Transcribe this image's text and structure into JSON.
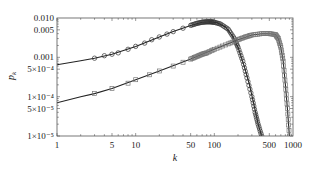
{
  "chart_data": {
    "type": "scatter",
    "title": "",
    "xlabel": "k",
    "ylabel": "p_k",
    "xscale": "log",
    "yscale": "log",
    "xlim": [
      1,
      1000
    ],
    "ylim": [
      1e-05,
      0.01
    ],
    "x_ticks": [
      1,
      5,
      10,
      50,
      100,
      500,
      1000
    ],
    "x_tick_labels": [
      "1",
      "5",
      "10",
      "50",
      "100",
      "500",
      "1000"
    ],
    "y_ticks": [
      1e-05,
      5e-05,
      0.0001,
      0.0005,
      0.001,
      0.005,
      0.01
    ],
    "y_tick_labels": [
      "1×10⁻⁵",
      "5×10⁻⁵",
      "1×10⁻⁴",
      "5×10⁻⁴",
      "0.001",
      "0.005",
      "0.010"
    ],
    "grid": false,
    "legend": null,
    "series": [
      {
        "name": "circles",
        "marker": "circle",
        "fit_line": true,
        "x": [
          3,
          4,
          5,
          6,
          8,
          10,
          13,
          16,
          20,
          25,
          30,
          40,
          50,
          60,
          70,
          80,
          90,
          100,
          120,
          150,
          180,
          200,
          230,
          260,
          300,
          330,
          360,
          400
        ],
        "y": [
          0.00095,
          0.0011,
          0.0012,
          0.0013,
          0.0016,
          0.0019,
          0.0023,
          0.0028,
          0.0033,
          0.0039,
          0.0045,
          0.0055,
          0.0065,
          0.0073,
          0.0078,
          0.008,
          0.008,
          0.0078,
          0.007,
          0.0052,
          0.003,
          0.0018,
          0.0008,
          0.0003,
          0.0001,
          4e-05,
          2e-05,
          1e-05
        ]
      },
      {
        "name": "squares",
        "marker": "square",
        "fit_line": true,
        "x": [
          3,
          5,
          8,
          10,
          15,
          20,
          30,
          40,
          50,
          60,
          70,
          80,
          100,
          150,
          200,
          250,
          300,
          400,
          500,
          600,
          650,
          700,
          750,
          800,
          850,
          900
        ],
        "y": [
          0.00012,
          0.00016,
          0.00022,
          0.00027,
          0.00036,
          0.00045,
          0.0006,
          0.00075,
          0.0009,
          0.00105,
          0.0012,
          0.0013,
          0.0016,
          0.0022,
          0.0028,
          0.0033,
          0.0037,
          0.004,
          0.004,
          0.0038,
          0.003,
          0.0018,
          0.0008,
          0.0002,
          5e-05,
          1e-05
        ]
      }
    ],
    "fit_lines": [
      {
        "name": "circles-fit",
        "x": [
          1,
          2,
          3,
          5,
          10,
          20,
          30,
          50,
          70,
          90,
          110,
          140,
          170,
          200,
          240,
          280,
          320,
          360,
          400
        ],
        "y": [
          0.00065,
          0.00082,
          0.00095,
          0.0012,
          0.0019,
          0.0033,
          0.0045,
          0.0065,
          0.0078,
          0.008,
          0.0075,
          0.0058,
          0.0035,
          0.0018,
          0.0006,
          0.0002,
          6e-05,
          2e-05,
          1e-05
        ]
      },
      {
        "name": "squares-fit",
        "x": [
          1,
          2,
          3,
          5,
          10,
          20,
          50,
          100,
          200,
          300,
          400,
          500,
          600,
          650,
          700,
          750,
          800,
          850,
          900
        ],
        "y": [
          7e-05,
          0.0001,
          0.00012,
          0.00016,
          0.00027,
          0.00045,
          0.0009,
          0.0016,
          0.0028,
          0.0037,
          0.004,
          0.004,
          0.0038,
          0.003,
          0.0018,
          0.0008,
          0.0002,
          5e-05,
          1e-05
        ]
      }
    ]
  }
}
